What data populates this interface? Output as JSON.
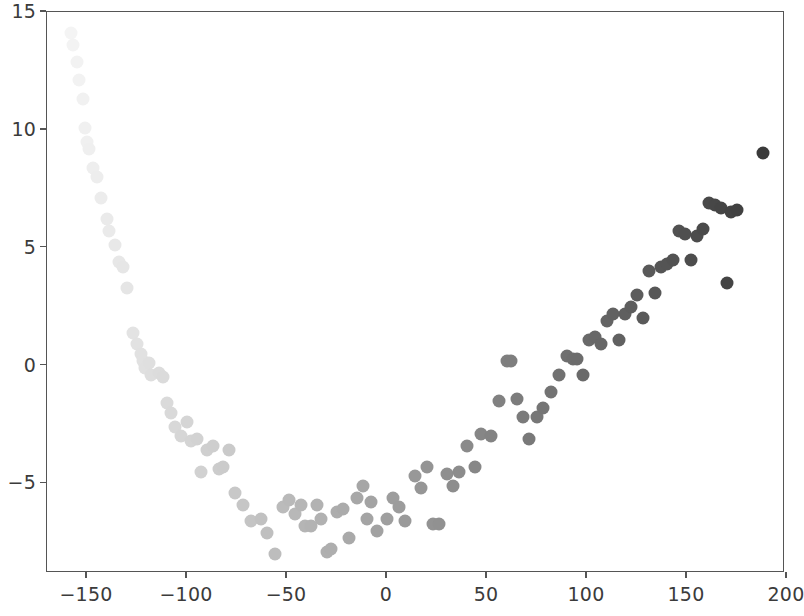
{
  "chart_data": {
    "type": "scatter",
    "title": "",
    "xlabel": "",
    "ylabel": "",
    "xlim": [
      -170,
      199
    ],
    "ylim": [
      -8.8,
      15.0
    ],
    "grid": false,
    "legend": null,
    "xticks": [
      -150,
      -100,
      -50,
      0,
      50,
      100,
      150,
      200
    ],
    "xticklabels": [
      "−150",
      "−100",
      "−50",
      "0",
      "50",
      "100",
      "150",
      "200"
    ],
    "yticks": [
      -5,
      0,
      5,
      10,
      15
    ],
    "yticklabels": [
      "−5",
      "0",
      "5",
      "10",
      "15"
    ],
    "marker": "circle",
    "marker_size": 13,
    "colormap": "greys-by-x",
    "color_min": "#f4f4f4",
    "color_max": "#3a3a3a",
    "axis_color": "#555555",
    "background": "#ffffff",
    "points": [
      [
        -158.0,
        14.1
      ],
      [
        -157.0,
        13.6
      ],
      [
        -155.0,
        12.9
      ],
      [
        -154.0,
        12.1
      ],
      [
        -152.0,
        11.3
      ],
      [
        -151.0,
        10.1
      ],
      [
        -150.0,
        9.5
      ],
      [
        -149.0,
        9.2
      ],
      [
        -147.0,
        8.4
      ],
      [
        -145.0,
        8.0
      ],
      [
        -143.0,
        7.1
      ],
      [
        -140.0,
        6.2
      ],
      [
        -139.0,
        5.7
      ],
      [
        -136.0,
        5.1
      ],
      [
        -134.0,
        4.4
      ],
      [
        -132.0,
        4.2
      ],
      [
        -130.0,
        3.3
      ],
      [
        -127.0,
        1.4
      ],
      [
        -125.0,
        0.9
      ],
      [
        -123.0,
        0.5
      ],
      [
        -122.0,
        0.2
      ],
      [
        -121.0,
        -0.1
      ],
      [
        -119.0,
        0.1
      ],
      [
        -118.0,
        -0.4
      ],
      [
        -114.0,
        -0.3
      ],
      [
        -112.0,
        -0.5
      ],
      [
        -110.0,
        -1.6
      ],
      [
        -108.0,
        -2.0
      ],
      [
        -106.0,
        -2.6
      ],
      [
        -103.0,
        -3.0
      ],
      [
        -100.0,
        -2.4
      ],
      [
        -98.0,
        -3.2
      ],
      [
        -95.0,
        -3.1
      ],
      [
        -93.0,
        -4.5
      ],
      [
        -90.0,
        -3.6
      ],
      [
        -87.0,
        -3.4
      ],
      [
        -84.0,
        -4.4
      ],
      [
        -82.0,
        -4.3
      ],
      [
        -79.0,
        -3.6
      ],
      [
        -76.0,
        -5.4
      ],
      [
        -72.0,
        -5.9
      ],
      [
        -68.0,
        -6.6
      ],
      [
        -63.0,
        -6.5
      ],
      [
        -60.0,
        -7.1
      ],
      [
        -56.0,
        -8.0
      ],
      [
        -52.0,
        -6.0
      ],
      [
        -49.0,
        -5.7
      ],
      [
        -46.0,
        -6.3
      ],
      [
        -43.0,
        -5.9
      ],
      [
        -41.0,
        -6.8
      ],
      [
        -38.0,
        -6.8
      ],
      [
        -35.0,
        -5.9
      ],
      [
        -33.0,
        -6.5
      ],
      [
        -30.0,
        -7.9
      ],
      [
        -28.0,
        -7.8
      ],
      [
        -25.0,
        -6.2
      ],
      [
        -22.0,
        -6.1
      ],
      [
        -19.0,
        -7.3
      ],
      [
        -15.0,
        -5.6
      ],
      [
        -12.0,
        -5.1
      ],
      [
        -10.0,
        -6.5
      ],
      [
        -8.0,
        -5.8
      ],
      [
        -5.0,
        -7.0
      ],
      [
        0.0,
        -6.5
      ],
      [
        3.0,
        -5.6
      ],
      [
        6.0,
        -6.0
      ],
      [
        9.0,
        -6.6
      ],
      [
        14.0,
        -4.7
      ],
      [
        17.0,
        -5.2
      ],
      [
        20.0,
        -4.3
      ],
      [
        23.0,
        -6.7
      ],
      [
        26.0,
        -6.7
      ],
      [
        30.0,
        -4.6
      ],
      [
        33.0,
        -5.1
      ],
      [
        36.0,
        -4.5
      ],
      [
        40.0,
        -3.4
      ],
      [
        44.0,
        -4.3
      ],
      [
        47.0,
        -2.9
      ],
      [
        52.0,
        -3.0
      ],
      [
        56.0,
        -1.5
      ],
      [
        60.0,
        0.2
      ],
      [
        62.0,
        0.2
      ],
      [
        65.0,
        -1.4
      ],
      [
        68.0,
        -2.2
      ],
      [
        71.0,
        -3.1
      ],
      [
        75.0,
        -2.2
      ],
      [
        78.0,
        -1.8
      ],
      [
        82.0,
        -1.1
      ],
      [
        86.0,
        -0.4
      ],
      [
        90.0,
        0.4
      ],
      [
        93.0,
        0.3
      ],
      [
        95.0,
        0.3
      ],
      [
        98.0,
        -0.4
      ],
      [
        101.0,
        1.1
      ],
      [
        104.0,
        1.2
      ],
      [
        107.0,
        0.9
      ],
      [
        110.0,
        1.9
      ],
      [
        113.0,
        2.2
      ],
      [
        116.0,
        1.1
      ],
      [
        119.0,
        2.2
      ],
      [
        122.0,
        2.5
      ],
      [
        125.0,
        3.0
      ],
      [
        128.0,
        2.0
      ],
      [
        131.0,
        4.0
      ],
      [
        134.0,
        3.1
      ],
      [
        137.0,
        4.2
      ],
      [
        140.0,
        4.3
      ],
      [
        143.0,
        4.5
      ],
      [
        146.0,
        5.7
      ],
      [
        149.0,
        5.6
      ],
      [
        152.0,
        4.5
      ],
      [
        155.0,
        5.5
      ],
      [
        158.0,
        5.8
      ],
      [
        161.0,
        6.9
      ],
      [
        164.0,
        6.8
      ],
      [
        167.0,
        6.7
      ],
      [
        170.0,
        3.5
      ],
      [
        172.0,
        6.5
      ],
      [
        175.0,
        6.6
      ],
      [
        188.0,
        9.0
      ]
    ]
  }
}
